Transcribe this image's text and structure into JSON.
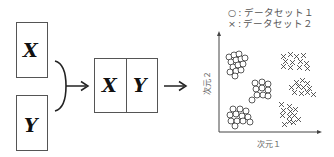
{
  "inputs": {
    "x_label": "X",
    "y_label": "Y"
  },
  "combined": {
    "x_label": "X",
    "y_label": "Y"
  },
  "legend": {
    "items": [
      {
        "marker": "○",
        "separator": ":",
        "label": "データセット１"
      },
      {
        "marker": "×",
        "separator": ":",
        "label": "データセット２"
      }
    ]
  },
  "plot": {
    "xlabel": "次元１",
    "ylabel": "次元２",
    "clusters": [
      {
        "dataset": "データセット１",
        "marker": "circle",
        "position": "upper-left"
      },
      {
        "dataset": "データセット１",
        "marker": "circle",
        "position": "middle-center"
      },
      {
        "dataset": "データセット１",
        "marker": "circle",
        "position": "lower-left"
      },
      {
        "dataset": "データセット２",
        "marker": "cross",
        "position": "upper-right"
      },
      {
        "dataset": "データセット２",
        "marker": "cross",
        "position": "middle-right"
      },
      {
        "dataset": "データセット２",
        "marker": "cross",
        "position": "lower-center-right"
      }
    ]
  },
  "colors": {
    "stroke": "#333333",
    "box_border": "#555555",
    "text": "#111111",
    "label_text": "#666666"
  }
}
